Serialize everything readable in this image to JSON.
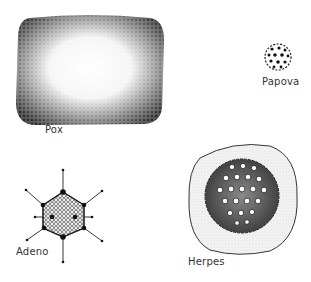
{
  "figure": {
    "viruses": [
      {
        "id": "pox",
        "label": "Pox",
        "shape": "brick-rounded-rectangle",
        "texture": "stippled-granular"
      },
      {
        "id": "papova",
        "label": "Papova",
        "shape": "small-sphere",
        "texture": "dotted-capsomeres"
      },
      {
        "id": "adeno",
        "label": "Adeno",
        "shape": "icosahedron-with-fibers",
        "spikes": 8
      },
      {
        "id": "herpes",
        "label": "Herpes",
        "shape": "enveloped-icosahedron",
        "texture": "ring-capsomeres"
      }
    ],
    "colors": {
      "ink": "#1a1a1a",
      "label": "#333333",
      "background": "#ffffff",
      "envelope_fill": "#ececec"
    }
  }
}
